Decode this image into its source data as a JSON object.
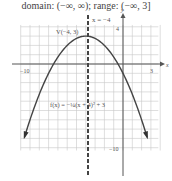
{
  "caption": "domain: (−∞, ∞); range: (−∞, 3]",
  "labels": {
    "axis_line": "x = −4",
    "vertex": "V(−4, 3)",
    "function": "f(x) = −¼(x + 4)² + 3",
    "x_axis": "x",
    "y_axis": "y",
    "x_min_tick": "−10",
    "x_max_tick": "3",
    "y_max_tick": "4",
    "y_min_tick": "−10"
  },
  "chart_data": {
    "type": "line",
    "title": "",
    "caption": "domain: (−∞, ∞); range: (−∞, 3]",
    "function": "f(x) = -1/4 (x + 4)^2 + 3",
    "vertex": [
      -4,
      3
    ],
    "axis_of_symmetry": "x = -4",
    "x": [
      -11,
      -10,
      -9,
      -8,
      -7,
      -6,
      -5,
      -4,
      -3,
      -2,
      -1,
      0,
      1,
      2,
      3
    ],
    "y": [
      -9.25,
      -6,
      -3.25,
      -1,
      0.75,
      2,
      2.75,
      3,
      2.75,
      2,
      0.75,
      -1,
      -3.25,
      -6,
      -9.25
    ],
    "xlabel": "x",
    "ylabel": "y",
    "xlim": [
      -11,
      4
    ],
    "ylim": [
      -11,
      4
    ],
    "tick_labels": {
      "x": [
        "-10",
        "3"
      ],
      "y": [
        "4",
        "-10"
      ]
    },
    "grid": true,
    "legend": null
  },
  "colors": {
    "curve": "#444444",
    "grid": "#c8c8c8",
    "axis": "#555555",
    "dashed": "#444444"
  }
}
